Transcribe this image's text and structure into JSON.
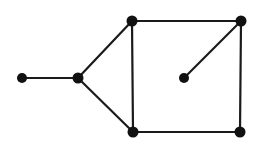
{
  "figure": {
    "width": 258,
    "height": 146,
    "background_color": "#ffffff",
    "edge_color": "#1a1a1a",
    "vertex_color": "#111111",
    "edge_width": 2.2,
    "vertex_radius": 5
  },
  "graph": {
    "vertex_count": 7,
    "edge_count": 8,
    "vertices": [
      {
        "id": "v1",
        "name": "pendant-left-vertex",
        "x": 22,
        "y": 78,
        "r": 5,
        "degree": 1
      },
      {
        "id": "v2",
        "name": "fork-vertex",
        "x": 78,
        "y": 78,
        "r": 5.5,
        "degree": 3
      },
      {
        "id": "v3",
        "name": "square-top-left-vertex",
        "x": 132,
        "y": 21,
        "r": 5.5,
        "degree": 3
      },
      {
        "id": "v4",
        "name": "square-top-right-vertex",
        "x": 241,
        "y": 21,
        "r": 5.5,
        "degree": 3
      },
      {
        "id": "v5",
        "name": "square-bottom-left-vertex",
        "x": 133,
        "y": 132,
        "r": 5.5,
        "degree": 3
      },
      {
        "id": "v6",
        "name": "square-bottom-right-vertex",
        "x": 240,
        "y": 132,
        "r": 5.5,
        "degree": 2
      },
      {
        "id": "v7",
        "name": "interior-vertex",
        "x": 184,
        "y": 78,
        "r": 5,
        "degree": 1
      }
    ],
    "edges": [
      {
        "id": "e1",
        "name": "edge-pendant-to-fork",
        "from": "v1",
        "to": "v2",
        "x1": 22,
        "y1": 78,
        "x2": 78,
        "y2": 78
      },
      {
        "id": "e2",
        "name": "edge-fork-to-top-left",
        "from": "v2",
        "to": "v3",
        "x1": 78,
        "y1": 78,
        "x2": 132,
        "y2": 21
      },
      {
        "id": "e3",
        "name": "edge-fork-to-bottom-left",
        "from": "v2",
        "to": "v5",
        "x1": 78,
        "y1": 78,
        "x2": 133,
        "y2": 132
      },
      {
        "id": "e4",
        "name": "edge-top-left-to-top-right",
        "from": "v3",
        "to": "v4",
        "x1": 132,
        "y1": 21,
        "x2": 241,
        "y2": 21
      },
      {
        "id": "e5",
        "name": "edge-top-left-to-bottom-left",
        "from": "v3",
        "to": "v5",
        "x1": 132,
        "y1": 21,
        "x2": 133,
        "y2": 132
      },
      {
        "id": "e6",
        "name": "edge-bottom-left-to-bottom-right",
        "from": "v5",
        "to": "v6",
        "x1": 133,
        "y1": 132,
        "x2": 240,
        "y2": 132
      },
      {
        "id": "e7",
        "name": "edge-top-right-to-bottom-right",
        "from": "v4",
        "to": "v6",
        "x1": 241,
        "y1": 21,
        "x2": 240,
        "y2": 132
      },
      {
        "id": "e8",
        "name": "edge-interior-to-top-right",
        "from": "v7",
        "to": "v4",
        "x1": 184,
        "y1": 78,
        "x2": 241,
        "y2": 21
      }
    ]
  }
}
